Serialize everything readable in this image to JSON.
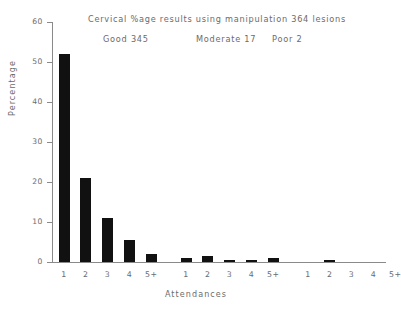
{
  "chart_data": {
    "type": "bar",
    "title": "Cervical %age results using manipulation  364  lesions",
    "subtitle_segments": [
      {
        "label": "Good 345"
      },
      {
        "label": "Moderate 17"
      },
      {
        "label": "Poor 2"
      }
    ],
    "xlabel": "Attendances",
    "ylabel": "Percentage",
    "ylim": [
      0,
      60
    ],
    "yticks": [
      0,
      10,
      20,
      30,
      40,
      50,
      60
    ],
    "ytick_labels": [
      "0",
      "10",
      "20",
      "30",
      "40",
      "50",
      "60"
    ],
    "grid": false,
    "legend": "none",
    "categories": [
      "1",
      "2",
      "3",
      "4",
      "5+"
    ],
    "groups": [
      {
        "name": "Good",
        "count": 345,
        "categories": [
          "1",
          "2",
          "3",
          "4",
          "5+"
        ],
        "values": [
          52,
          21,
          11,
          5.5,
          2
        ]
      },
      {
        "name": "Moderate",
        "count": 17,
        "categories": [
          "1",
          "2",
          "3",
          "4",
          "5+"
        ],
        "values": [
          1,
          1.4,
          0.6,
          0.4,
          0.9
        ]
      },
      {
        "name": "Poor",
        "count": 2,
        "categories": [
          "1",
          "2",
          "3",
          "4",
          "5+"
        ],
        "values": [
          0,
          0.4,
          0,
          0,
          0
        ]
      }
    ],
    "bar_color": "#111111",
    "axis_color": "#8a8a8a",
    "text_color": "#6b6b6b"
  }
}
